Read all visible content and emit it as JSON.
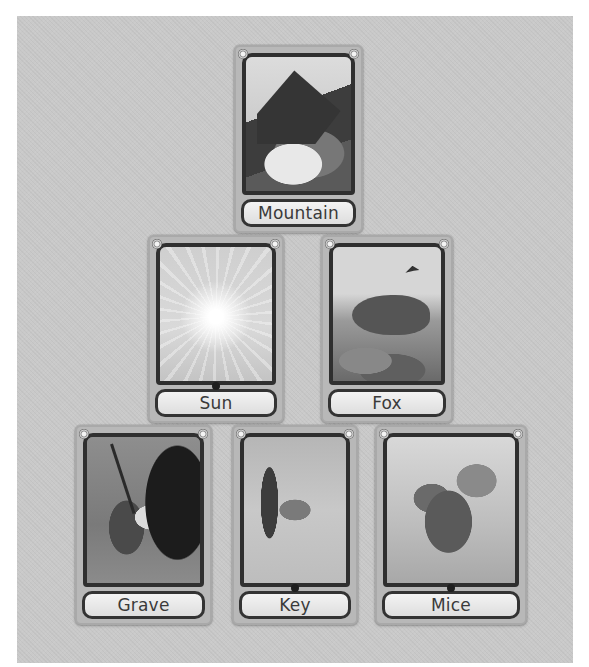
{
  "board": {
    "background": "#c9c9c9",
    "layout": "pyramid",
    "rows": [
      {
        "cards": [
          {
            "id": "mountain",
            "label": "Mountain",
            "art": "mountain-peak"
          }
        ]
      },
      {
        "cards": [
          {
            "id": "sun",
            "label": "Sun",
            "art": "radiant-sun"
          },
          {
            "id": "fox",
            "label": "Fox",
            "art": "fox-on-rocks"
          }
        ]
      },
      {
        "cards": [
          {
            "id": "grave",
            "label": "Grave",
            "art": "gravedigger-cave"
          },
          {
            "id": "key",
            "label": "Key",
            "art": "key-in-mist"
          },
          {
            "id": "mice",
            "label": "Mice",
            "art": "mouse-on-branch"
          }
        ]
      }
    ]
  }
}
